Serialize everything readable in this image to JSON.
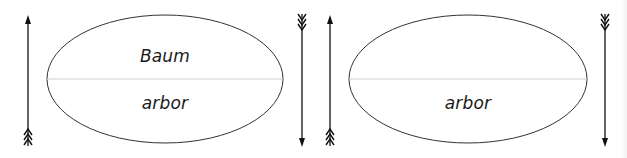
{
  "diagram": {
    "panels": [
      {
        "id": "panel-1",
        "top_label": "Baum",
        "bottom_label": "arbor",
        "ellipse": {
          "cx": 165,
          "cy": 79,
          "rx": 118,
          "ry": 64
        },
        "left_arrow": {
          "x": 28,
          "direction": "up",
          "fletching": "bottom"
        },
        "right_arrow": {
          "x": 302,
          "direction": "down",
          "fletching": "top"
        }
      },
      {
        "id": "panel-2",
        "top_label": "",
        "bottom_label": "arbor",
        "ellipse": {
          "cx": 468,
          "cy": 79,
          "rx": 119,
          "ry": 64
        },
        "left_arrow": {
          "x": 330,
          "direction": "up",
          "fletching": "bottom"
        },
        "right_arrow": {
          "x": 605,
          "direction": "down",
          "fletching": "top"
        }
      }
    ],
    "colors": {
      "outline": "#333333",
      "arrow": "#111111",
      "divider": "#d0d0d0",
      "text": "#1a1a1a"
    }
  }
}
